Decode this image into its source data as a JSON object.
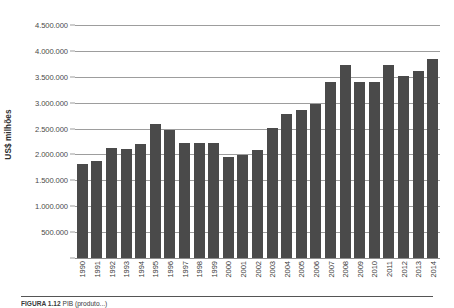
{
  "chart_data": {
    "type": "bar",
    "title": "",
    "subtitle": "",
    "xlabel": "",
    "ylabel": "US$ milhões",
    "ylim": [
      0,
      4500000
    ],
    "ytick_step": 500000,
    "grid": true,
    "legend": false,
    "bar_color": "#4a4a4a",
    "grid_color": "#9d9d9d",
    "ytick_labels": [
      "4.500.000",
      "4.000.000",
      "3.500.000",
      "3.000.000",
      "2.500.000",
      "2.000.000",
      "1.500.000",
      "1.000.000",
      "500.000"
    ],
    "ytick_values": [
      4500000,
      4000000,
      3500000,
      3000000,
      2500000,
      2000000,
      1500000,
      1000000,
      500000
    ],
    "categories": [
      "1990",
      "1991",
      "1992",
      "1993",
      "1994",
      "1995",
      "1996",
      "1997",
      "1998",
      "1999",
      "2000",
      "2001",
      "2002",
      "2003",
      "2004",
      "2005",
      "2006",
      "2007",
      "2008",
      "2009",
      "2010",
      "2011",
      "2012",
      "2013",
      "2014"
    ],
    "values": [
      1810000,
      1880000,
      2120000,
      2100000,
      2210000,
      2590000,
      2480000,
      2230000,
      2220000,
      2220000,
      1960000,
      1990000,
      2080000,
      2520000,
      2790000,
      2850000,
      2980000,
      3400000,
      3730000,
      3400000,
      3400000,
      3730000,
      3510000,
      3610000,
      3850000
    ]
  },
  "caption": {
    "lead": "FIGURA 1.12",
    "text": " PIB (produto...)"
  },
  "axis": {
    "y_title": "US$ milhões"
  }
}
